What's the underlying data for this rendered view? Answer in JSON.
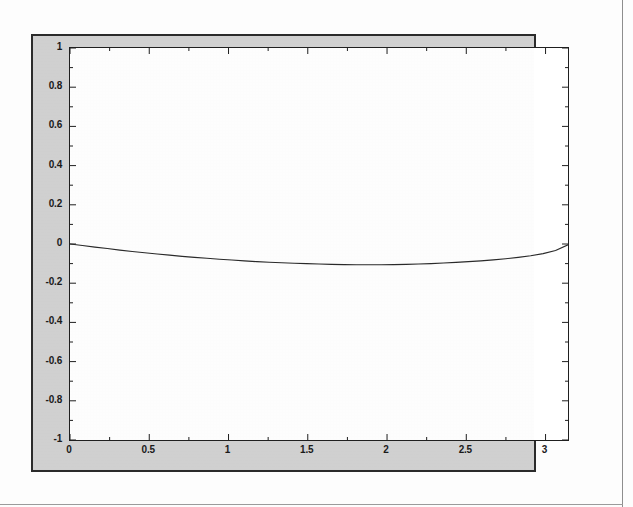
{
  "figure": {
    "window_label": "matlab-figure",
    "background_color": "#d2d2d2",
    "border_color": "#2b2b2b",
    "axes_background_color": "#ffffff",
    "axes_border_color": "#1f1f1f"
  },
  "chart_data": {
    "type": "line",
    "title": "",
    "subtitle": "",
    "xlabel": "",
    "ylabel": "",
    "xlim": [
      0,
      3.1416
    ],
    "ylim": [
      -1,
      1
    ],
    "grid": false,
    "legend": null,
    "legend_position": "none",
    "line_color": "#2a2a2a",
    "line_width": 1,
    "xticks": [
      0,
      0.5,
      1,
      1.5,
      2,
      2.5,
      3
    ],
    "xtick_labels": [
      "0",
      "0.5",
      "1",
      "1.5",
      "2",
      "2.5",
      "3"
    ],
    "yticks": [
      1,
      0.8,
      0.6,
      0.4,
      0.2,
      0,
      -0.2,
      -0.4,
      -0.6,
      -0.8,
      -1
    ],
    "ytick_labels": [
      "1",
      "0.8",
      "0.6",
      "0.4",
      "0.2",
      "0",
      "-0.2",
      "-0.4",
      "-0.6",
      "-0.8",
      "-1"
    ],
    "x_minor_ticks": [
      0.25,
      0.75,
      1.25,
      1.75,
      2.25,
      2.75
    ],
    "y_minor_ticks": [
      0.9,
      0.7,
      0.5,
      0.3,
      0.1,
      -0.1,
      -0.3,
      -0.5,
      -0.7,
      -0.9
    ],
    "series": [
      {
        "name": "curve",
        "x": [
          0.0,
          0.0785,
          0.1571,
          0.2356,
          0.3142,
          0.3927,
          0.4712,
          0.5498,
          0.6283,
          0.7069,
          0.7854,
          0.8639,
          0.9425,
          1.021,
          1.0996,
          1.1781,
          1.2566,
          1.3352,
          1.4137,
          1.4923,
          1.5708,
          1.6493,
          1.7279,
          1.8064,
          1.885,
          1.9635,
          2.042,
          2.1206,
          2.1991,
          2.2777,
          2.3562,
          2.4347,
          2.5133,
          2.5918,
          2.6704,
          2.7489,
          2.8274,
          2.906,
          2.9845,
          3.0631,
          3.1416
        ],
        "y": [
          0.0,
          -0.008,
          -0.016,
          -0.023,
          -0.031,
          -0.038,
          -0.045,
          -0.051,
          -0.057,
          -0.063,
          -0.068,
          -0.073,
          -0.078,
          -0.082,
          -0.086,
          -0.09,
          -0.093,
          -0.096,
          -0.098,
          -0.1,
          -0.102,
          -0.104,
          -0.105,
          -0.106,
          -0.106,
          -0.106,
          -0.105,
          -0.104,
          -0.102,
          -0.1,
          -0.097,
          -0.094,
          -0.09,
          -0.086,
          -0.081,
          -0.075,
          -0.068,
          -0.06,
          -0.049,
          -0.033,
          -0.004
        ]
      }
    ]
  }
}
